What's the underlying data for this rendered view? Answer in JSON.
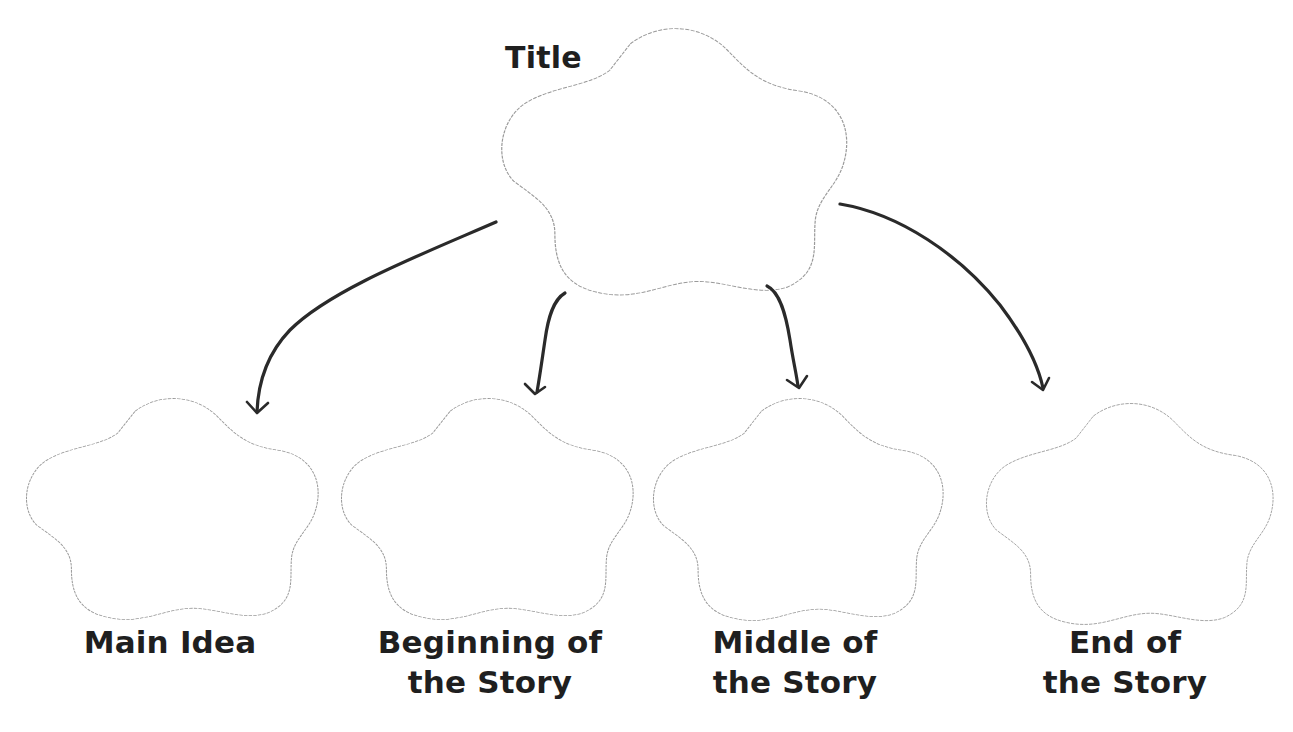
{
  "diagram": {
    "type": "story-map graphic organizer",
    "root": {
      "label": "Title"
    },
    "children": [
      {
        "line1": "Main Idea",
        "line2": ""
      },
      {
        "line1": "Beginning of",
        "line2": "the Story"
      },
      {
        "line1": "Middle of",
        "line2": "the Story"
      },
      {
        "line1": "End of",
        "line2": "the Story"
      }
    ],
    "colors": {
      "background": "#ffffff",
      "shape_outline": "#9a9a9a",
      "arrow": "#2a2a2a",
      "text": "#1f1f1f"
    }
  }
}
